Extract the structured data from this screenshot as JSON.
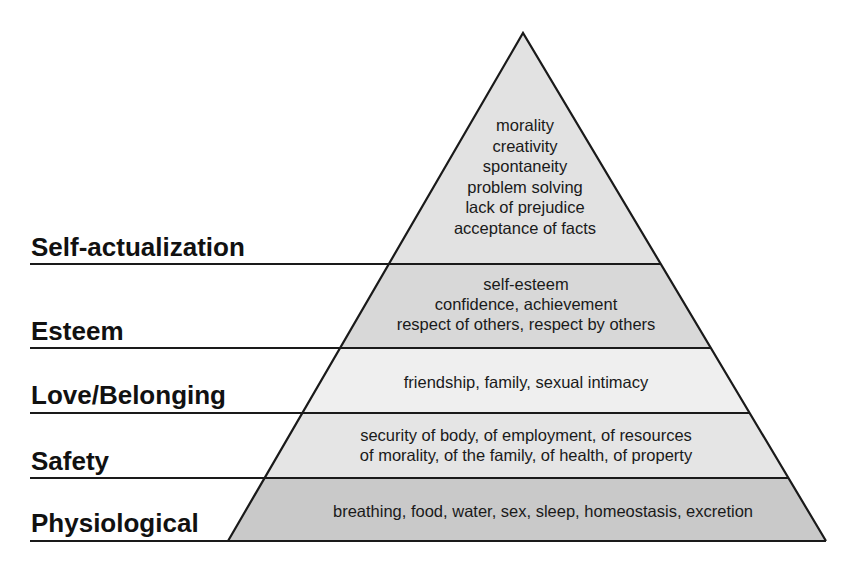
{
  "diagram": {
    "type": "pyramid",
    "levels": [
      {
        "name": "Self-actualization",
        "items": [
          "morality",
          "creativity",
          "spontaneity",
          "problem solving",
          "lack of prejudice",
          "acceptance of facts"
        ],
        "fill": "#e2e2e2"
      },
      {
        "name": "Esteem",
        "items": [
          "self-esteem",
          "confidence, achievement",
          "respect of others, respect by others"
        ],
        "fill": "#d8d8d8"
      },
      {
        "name": "Love/Belonging",
        "items": [
          "friendship, family, sexual intimacy"
        ],
        "fill": "#efefef"
      },
      {
        "name": "Safety",
        "items": [
          "security of body, of employment, of resources",
          "of morality, of the family, of health, of property"
        ],
        "fill": "#e5e5e5"
      },
      {
        "name": "Physiological",
        "items": [
          "breathing, food, water, sex, sleep, homeostasis, excretion"
        ],
        "fill": "#c9c9c9"
      }
    ],
    "stroke_color": "#1a1a1a"
  }
}
